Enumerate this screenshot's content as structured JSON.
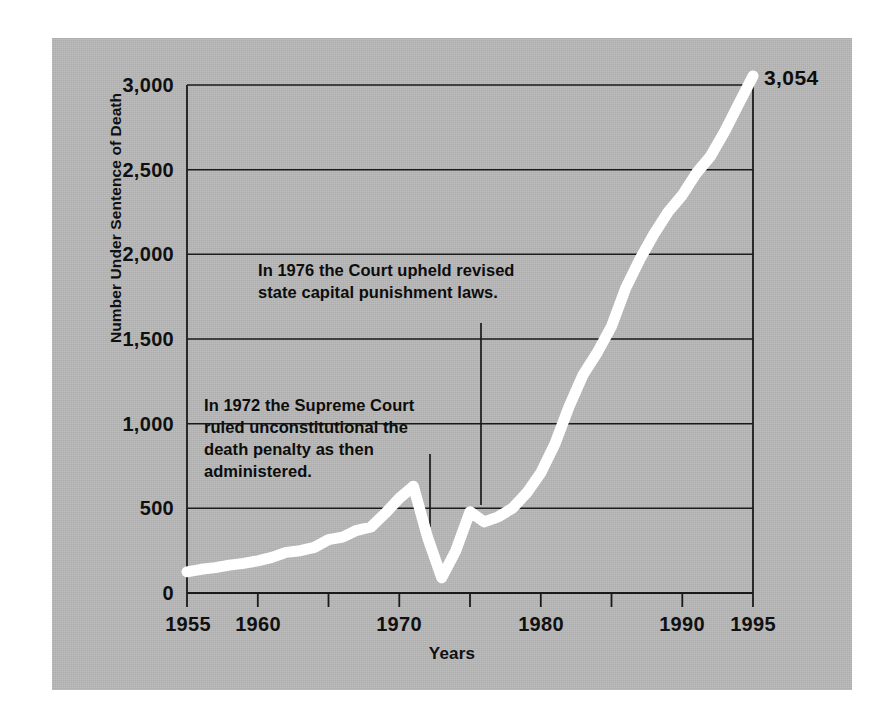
{
  "figure": {
    "panel_background": "#b7b7b7",
    "line_color": "#ffffff",
    "axis_color": "#1a1a1a",
    "text_color": "#101010"
  },
  "axes": {
    "y_title": "Number Under Sentence of Death",
    "x_title": "Years",
    "y_ticks": [
      "0",
      "500",
      "1,000",
      "1,500",
      "2,000",
      "2,500",
      "3,000"
    ],
    "x_ticks": [
      "1955",
      "1960",
      "1970",
      "1980",
      "1990",
      "1995"
    ]
  },
  "annotations": {
    "a1976": "In 1976 the Court upheld revised\nstate capital punishment laws.",
    "a1972": "In 1972 the Supreme Court\nruled unconstitutional the\ndeath penalty as then\nadministered."
  },
  "endpoint_label": "3,054",
  "chart_data": {
    "type": "line",
    "title": "",
    "subtitle": "",
    "xlabel": "Years",
    "ylabel": "Number Under Sentence of Death",
    "xlim": [
      1955,
      1995
    ],
    "ylim": [
      0,
      3000
    ],
    "xticks": [
      1955,
      1960,
      1965,
      1970,
      1975,
      1980,
      1985,
      1990,
      1995
    ],
    "xticklabels": [
      "1955",
      "1960",
      "",
      "1970",
      "",
      "1980",
      "",
      "1990",
      "1995"
    ],
    "yticks": [
      0,
      500,
      1000,
      1500,
      2000,
      2500,
      3000
    ],
    "yticklabels": [
      "0",
      "500",
      "1,000",
      "1,500",
      "2,000",
      "2,500",
      "3,000"
    ],
    "grid": "horizontal",
    "legend": "none",
    "line_color": "#ffffff",
    "line_width": 11,
    "annotations": [
      {
        "text": "In 1976 the Court upheld revised state capital punishment laws.",
        "year": 1976,
        "leader_from_y": 2300,
        "leader_to_y": 560
      },
      {
        "text": "In 1972 the Supreme Court ruled unconstitutional the death penalty as then administered.",
        "year": 1972.5,
        "leader_from_y": 1520,
        "leader_to_y": 320
      },
      {
        "text": "3,054",
        "year": 1995,
        "value": 3054
      }
    ],
    "series": [
      {
        "name": "Number Under Sentence of Death",
        "x": [
          1955,
          1956,
          1957,
          1958,
          1959,
          1960,
          1961,
          1962,
          1963,
          1964,
          1965,
          1966,
          1967,
          1968,
          1969,
          1970,
          1971,
          1972,
          1973,
          1974,
          1975,
          1976,
          1977,
          1978,
          1979,
          1980,
          1981,
          1982,
          1983,
          1984,
          1985,
          1986,
          1987,
          1988,
          1989,
          1990,
          1991,
          1992,
          1993,
          1994,
          1995
        ],
        "values": [
          125,
          140,
          150,
          165,
          175,
          190,
          210,
          240,
          250,
          270,
          315,
          330,
          370,
          390,
          470,
          560,
          630,
          330,
          90,
          250,
          480,
          420,
          450,
          500,
          590,
          710,
          880,
          1100,
          1290,
          1420,
          1575,
          1800,
          1970,
          2120,
          2250,
          2350,
          2480,
          2580,
          2725,
          2890,
          3054
        ]
      }
    ]
  }
}
